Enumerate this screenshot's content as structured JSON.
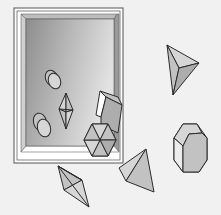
{
  "scene": {
    "description": "Line illustration of a glass-framed tray with crystal and geometric solids inside and scattered around it",
    "background_color": "#f1f1f1",
    "frame": {
      "outer_color": "#ffffff",
      "border_color": "#555555",
      "panel_gradient": [
        "#8f8f8f",
        "#dcdcdc"
      ]
    },
    "objects": [
      {
        "name": "ellipse-pair-upper",
        "type": "cylinder-disks"
      },
      {
        "name": "bipyramid-small",
        "type": "bipyramid"
      },
      {
        "name": "ellipse-pair-lower",
        "type": "cylinder-disks"
      },
      {
        "name": "rhombic-prism",
        "type": "prism"
      },
      {
        "name": "hexagonal-prism",
        "type": "hexagon"
      },
      {
        "name": "tetrahedron-upper-right",
        "type": "tetrahedron"
      },
      {
        "name": "tetrahedron-middle",
        "type": "tetrahedron"
      },
      {
        "name": "octagonal-crystal",
        "type": "octagonal-prism"
      },
      {
        "name": "bipyramid-bottom",
        "type": "bipyramid"
      }
    ]
  }
}
